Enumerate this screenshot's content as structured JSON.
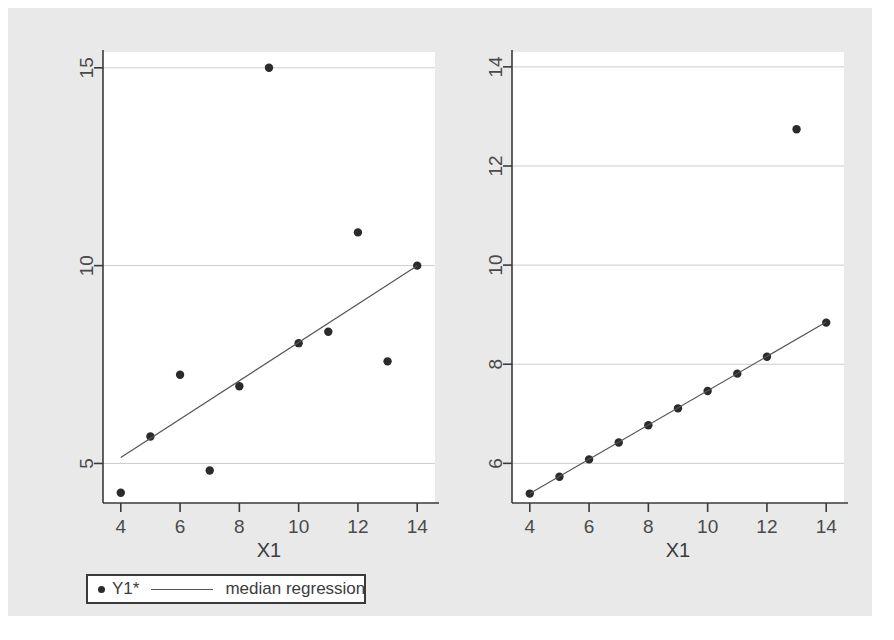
{
  "figure": {
    "background_color": "#e9e9e9",
    "plot_background_color": "#ffffff",
    "marker_color": "#2b2b2b",
    "line_color": "#555555",
    "grid_color": "#cccccc",
    "axis_color": "#3a3a3a"
  },
  "panels": [
    {
      "id": "left",
      "xlabel": "X1",
      "legend": {
        "series_label": "Y1*",
        "fit_label": "median regression"
      }
    },
    {
      "id": "right",
      "xlabel": "X1",
      "legend": {
        "series_label": "Y3",
        "fit_label": "median regression"
      }
    }
  ],
  "chart_data": [
    {
      "type": "scatter",
      "title": "",
      "xlabel": "X1",
      "ylabel": "",
      "xlim": [
        3.4,
        14.6
      ],
      "ylim": [
        4.0,
        15.4
      ],
      "xticks": [
        4,
        6,
        8,
        10,
        12,
        14
      ],
      "yticks": [
        5,
        10,
        15
      ],
      "grid": true,
      "legend_position": "below",
      "series": [
        {
          "name": "Y1*",
          "kind": "points",
          "x": [
            10,
            8,
            13,
            9,
            11,
            14,
            6,
            4,
            12,
            7,
            5
          ],
          "y": [
            8.04,
            6.95,
            7.58,
            15.0,
            8.33,
            10.0,
            7.24,
            4.26,
            10.84,
            4.82,
            5.68
          ]
        },
        {
          "name": "median regression",
          "kind": "line",
          "x": [
            4,
            14
          ],
          "y": [
            5.15,
            10.0
          ]
        }
      ]
    },
    {
      "type": "scatter",
      "title": "",
      "xlabel": "X1",
      "ylabel": "",
      "xlim": [
        3.4,
        14.6
      ],
      "ylim": [
        5.2,
        14.3
      ],
      "xticks": [
        4,
        6,
        8,
        10,
        12,
        14
      ],
      "yticks": [
        6,
        8,
        10,
        12,
        14
      ],
      "grid": true,
      "legend_position": "below",
      "series": [
        {
          "name": "Y3",
          "kind": "points",
          "x": [
            10,
            8,
            13,
            9,
            11,
            14,
            6,
            4,
            12,
            7,
            5
          ],
          "y": [
            7.46,
            6.77,
            12.74,
            7.11,
            7.81,
            8.84,
            6.08,
            5.39,
            8.15,
            6.42,
            5.73
          ]
        },
        {
          "name": "median regression",
          "kind": "line",
          "x": [
            4,
            14
          ],
          "y": [
            5.39,
            8.85
          ]
        }
      ]
    }
  ]
}
